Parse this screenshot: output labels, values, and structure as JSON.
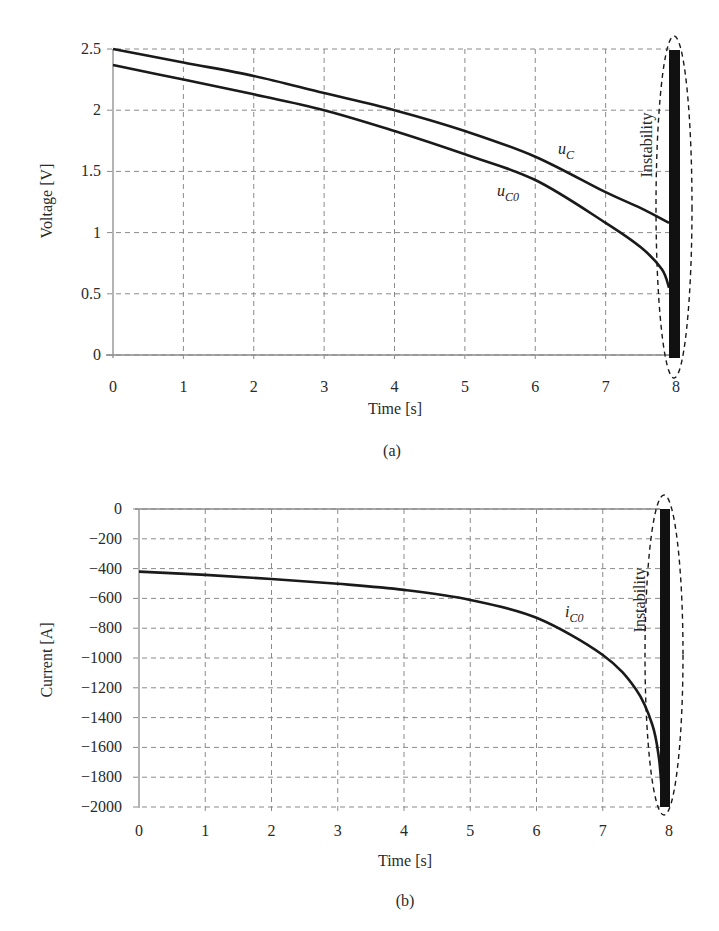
{
  "chart_data": [
    {
      "type": "line",
      "panel": "(a)",
      "caption": "(a)",
      "title": "",
      "xlabel": "Time [s]",
      "ylabel": "Voltage [V]",
      "xlim": [
        0,
        8
      ],
      "ylim": [
        0,
        2.5
      ],
      "xticks": [
        "0",
        "1",
        "2",
        "3",
        "4",
        "5",
        "6",
        "7",
        "8"
      ],
      "yticks": [
        "0",
        "0.5",
        "1",
        "1.5",
        "2",
        "2.5"
      ],
      "grid": true,
      "legend": "inline labels",
      "series": [
        {
          "name": "u_C",
          "label_main": "u",
          "label_sub": "C",
          "x": [
            0,
            1,
            2,
            3,
            4,
            5,
            6,
            7,
            7.5,
            7.9
          ],
          "values": [
            2.5,
            2.39,
            2.28,
            2.14,
            2.0,
            1.83,
            1.62,
            1.33,
            1.2,
            1.08
          ]
        },
        {
          "name": "u_C0",
          "label_main": "u",
          "label_sub": "C0",
          "x": [
            0,
            1,
            2,
            3,
            4,
            5,
            6,
            7,
            7.5,
            7.8,
            7.9
          ],
          "values": [
            2.37,
            2.25,
            2.13,
            2.0,
            1.83,
            1.64,
            1.43,
            1.08,
            0.88,
            0.7,
            0.55
          ]
        }
      ],
      "annotations": [
        {
          "text": "Instability",
          "type": "dashed ellipse around oscillation band",
          "x": 7.95,
          "y_range": [
            0,
            2.5
          ]
        }
      ]
    },
    {
      "type": "line",
      "panel": "(b)",
      "caption": "(b)",
      "title": "",
      "xlabel": "Time [s]",
      "ylabel": "Current [A]",
      "xlim": [
        0,
        8
      ],
      "ylim": [
        -2000,
        0
      ],
      "xticks": [
        "0",
        "1",
        "2",
        "3",
        "4",
        "5",
        "6",
        "7",
        "8"
      ],
      "yticks": [
        "0",
        "-200",
        "-400",
        "-600",
        "-800",
        "-1000",
        "-1200",
        "-1400",
        "-1600",
        "-1800",
        "-2000"
      ],
      "grid": true,
      "legend": "inline labels",
      "series": [
        {
          "name": "i_C0",
          "label_main": "i",
          "label_sub": "C0",
          "x": [
            0,
            1,
            2,
            3,
            4,
            5,
            6,
            7,
            7.5,
            7.75,
            7.85,
            7.9
          ],
          "values": [
            -420,
            -442,
            -470,
            -502,
            -543,
            -610,
            -730,
            -980,
            -1210,
            -1450,
            -1680,
            -1950
          ]
        }
      ],
      "annotations": [
        {
          "text": "Instability",
          "type": "dashed ellipse around oscillation band",
          "x": 7.95,
          "y_range": [
            -2000,
            0
          ]
        }
      ]
    }
  ],
  "panels": {
    "a": {
      "ylabel": "Voltage [V]",
      "xlabel": "Time [s]",
      "caption": "(a)",
      "annotation": "Instability",
      "xticks": [
        "0",
        "1",
        "2",
        "3",
        "4",
        "5",
        "6",
        "7",
        "8"
      ],
      "yticks": [
        "0",
        "0.5",
        "1",
        "1.5",
        "2",
        "2.5"
      ],
      "series_labels": [
        {
          "main": "u",
          "sub": "C"
        },
        {
          "main": "u",
          "sub": "C0"
        }
      ]
    },
    "b": {
      "ylabel": "Current [A]",
      "xlabel": "Time [s]",
      "caption": "(b)",
      "annotation": "Instability",
      "xticks": [
        "0",
        "1",
        "2",
        "3",
        "4",
        "5",
        "6",
        "7",
        "8"
      ],
      "yticks": [
        "0",
        "-200",
        "-400",
        "-600",
        "-800",
        "-1000",
        "-1200",
        "-1400",
        "-1600",
        "-1800",
        "-2000"
      ],
      "series_labels": [
        {
          "main": "i",
          "sub": "C0"
        }
      ]
    }
  },
  "colors": {
    "curve": "#1a1a1a",
    "grid": "#8a8a8a",
    "background": "#ffffff"
  }
}
